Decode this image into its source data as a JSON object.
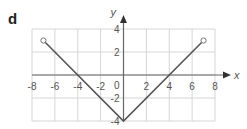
{
  "panel_label": "d",
  "chart_data": {
    "type": "line",
    "title": "",
    "xlabel": "x",
    "ylabel": "y",
    "xlim": [
      -8,
      8
    ],
    "ylim": [
      -4,
      4
    ],
    "grid": true,
    "grid_step": 2,
    "xticks": [
      -8,
      -6,
      -4,
      -2,
      2,
      4,
      6,
      8
    ],
    "yticks": [
      4,
      2,
      -2,
      -4
    ],
    "origin_label": "0",
    "series": [
      {
        "name": "graph",
        "points": [
          [
            -7,
            3
          ],
          [
            0,
            -4
          ],
          [
            7,
            3
          ]
        ],
        "endpoints": [
          {
            "x": -7,
            "y": 3,
            "style": "open-circle"
          },
          {
            "x": 7,
            "y": 3,
            "style": "open-circle"
          }
        ]
      }
    ],
    "colors": {
      "line": "#555555",
      "grid": "#d6d6d6",
      "axis": "#666666"
    }
  }
}
